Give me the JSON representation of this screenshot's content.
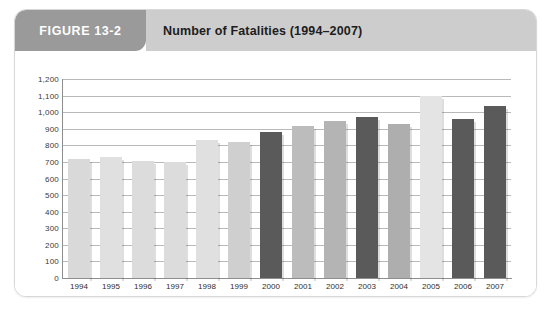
{
  "figure": {
    "badge_label": "FIGURE 13-2",
    "title": "Number of Fatalities (1994–2007)"
  },
  "colors": {
    "badge_bg": "#9a9a9a",
    "titlebar_bg": "#cdcdcd",
    "bar_light": "#d9d9d9",
    "bar_medium": "#bcbcbc",
    "bar_dark": "#5a5a5a",
    "bar_pale": "#e4e4e4",
    "gridline": "#b9b9b9",
    "axis": "#8e8e8e",
    "card_border": "#d8d8d8"
  },
  "chart_data": {
    "type": "bar",
    "title": "Number of Fatalities (1994–2007)",
    "xlabel": "Year",
    "ylabel": "",
    "ylim": [
      0,
      1200
    ],
    "ytick_step": 100,
    "grid": true,
    "legend": "none",
    "categories": [
      "1994",
      "1995",
      "1996",
      "1997",
      "1998",
      "1999",
      "2000",
      "2001",
      "2002",
      "2003",
      "2004",
      "2005",
      "2006",
      "2007"
    ],
    "values": [
      720,
      730,
      705,
      700,
      830,
      820,
      880,
      915,
      945,
      970,
      930,
      1100,
      960,
      1040
    ],
    "bar_colors": [
      "#d9d9d9",
      "#e0e0e0",
      "#dcdcdc",
      "#dcdcdc",
      "#e0e0e0",
      "#cfcfcf",
      "#5a5a5a",
      "#bcbcbc",
      "#b4b4b4",
      "#5a5a5a",
      "#aeaeae",
      "#e4e4e4",
      "#5a5a5a",
      "#5a5a5a"
    ],
    "ytick_labels": [
      "1,200",
      "1,100",
      "1,000",
      "900",
      "800",
      "700",
      "600",
      "500",
      "400",
      "300",
      "200",
      "100",
      "0"
    ],
    "ytick_values": [
      1200,
      1100,
      1000,
      900,
      800,
      700,
      600,
      500,
      400,
      300,
      200,
      100,
      0
    ]
  }
}
